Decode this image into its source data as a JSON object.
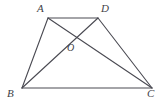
{
  "figure": {
    "type": "geometry-diagram",
    "shape": "trapezoid-with-diagonals",
    "background_color": "#ffffff",
    "stroke_color": "#4a4a52",
    "stroke_width": 1.1,
    "label_color": "#3f3f47",
    "canvas": {
      "width": 168,
      "height": 104
    },
    "points": [
      {
        "id": "A",
        "label": "A",
        "x": 48,
        "y": 18,
        "label_x": 37,
        "label_y": 3
      },
      {
        "id": "D",
        "label": "D",
        "x": 98,
        "y": 18,
        "label_x": 101,
        "label_y": 3
      },
      {
        "id": "O",
        "label": "O",
        "x": 78,
        "y": 37,
        "label_x": 67,
        "label_y": 42
      },
      {
        "id": "B",
        "label": "B",
        "x": 22,
        "y": 88,
        "label_x": 7,
        "label_y": 88
      },
      {
        "id": "C",
        "label": "C",
        "x": 152,
        "y": 88,
        "label_x": 147,
        "label_y": 88
      }
    ],
    "segments": [
      {
        "id": "AD",
        "from": "A",
        "to": "D",
        "role": "top-side"
      },
      {
        "id": "AB",
        "from": "A",
        "to": "B",
        "role": "left-side"
      },
      {
        "id": "DC",
        "from": "D",
        "to": "C",
        "role": "right-side"
      },
      {
        "id": "BC",
        "from": "B",
        "to": "C",
        "role": "bottom-side"
      },
      {
        "id": "AC",
        "from": "A",
        "to": "C",
        "role": "diagonal"
      },
      {
        "id": "BD",
        "from": "B",
        "to": "D",
        "role": "diagonal"
      }
    ],
    "intersection": {
      "id": "O",
      "of": [
        "AC",
        "BD"
      ]
    }
  }
}
